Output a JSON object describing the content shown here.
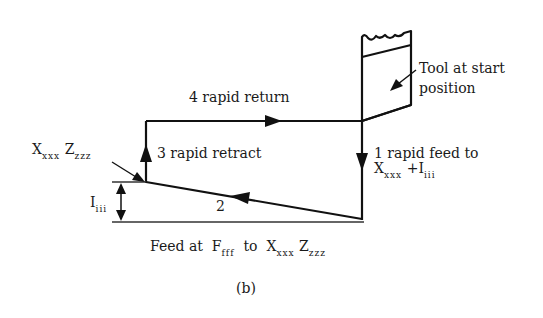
{
  "diagram": {
    "caption": "(b)",
    "labels": {
      "rapid_return": "4 rapid return",
      "rapid_retract": "3 rapid retract",
      "rapid_feed_line1": "1 rapid feed to",
      "rapid_feed_x": "X",
      "rapid_feed_x_sub": "xxx",
      "rapid_feed_plus": "+I",
      "rapid_feed_i_sub": "iii",
      "tool_line1": "Tool at start",
      "tool_line2": "position",
      "point_x": "X",
      "point_x_sub": "xxx",
      "point_z": "Z",
      "point_z_sub": "zzz",
      "increment": "I",
      "increment_sub": "iii",
      "feed_step": "2",
      "feed_prefix": "Feed at",
      "feed_f": "F",
      "feed_f_sub": "fff",
      "feed_to": "to",
      "feed_x": "X",
      "feed_x_sub": "xxx",
      "feed_z": "Z",
      "feed_z_sub": "zzz"
    },
    "colors": {
      "line": "#111111",
      "background": "#ffffff"
    }
  }
}
